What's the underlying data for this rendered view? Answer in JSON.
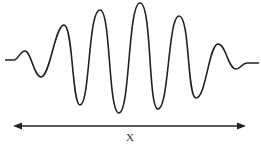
{
  "diagram": {
    "type": "wave-packet",
    "colors": {
      "stroke": "#222222",
      "background": "#ffffff"
    },
    "wave_points": [
      [
        5,
        60
      ],
      [
        15,
        60
      ],
      [
        25,
        51
      ],
      [
        41,
        77
      ],
      [
        64,
        25
      ],
      [
        80,
        105
      ],
      [
        100,
        10
      ],
      [
        119,
        113
      ],
      [
        140,
        3
      ],
      [
        158,
        109
      ],
      [
        179,
        16
      ],
      [
        196,
        98
      ],
      [
        218,
        44
      ],
      [
        236,
        69
      ],
      [
        246,
        63
      ],
      [
        259,
        63
      ]
    ],
    "arrow": {
      "x1": 13,
      "x2": 246,
      "y": 126,
      "heads": "both"
    },
    "arrow_label": "X"
  }
}
